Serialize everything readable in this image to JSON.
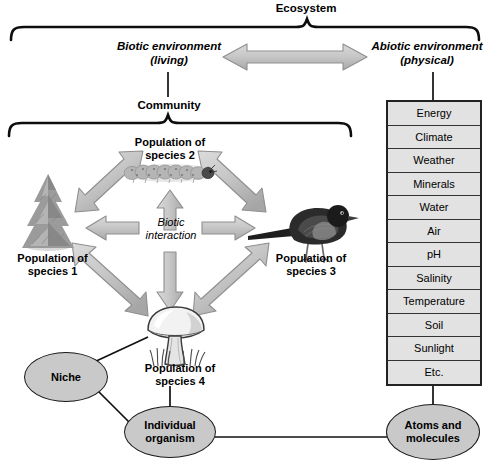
{
  "diagram": {
    "ecosystem_label": "Ecosystem",
    "biotic_label": "Biotic environment\n(living)",
    "abiotic_label": "Abiotic environment\n(physical)",
    "community_label": "Community",
    "biotic_interaction_label": "Biotic\ninteraction"
  },
  "populations": [
    {
      "id": "species1",
      "label": "Population of\nspecies 1",
      "organism": "conifer-tree"
    },
    {
      "id": "species2",
      "label": "Population of\nspecies 2",
      "organism": "caterpillar"
    },
    {
      "id": "species3",
      "label": "Population of\nspecies 3",
      "organism": "bird"
    },
    {
      "id": "species4",
      "label": "Population of\nspecies 4",
      "organism": "mushroom"
    }
  ],
  "abiotic_factors": [
    "Energy",
    "Climate",
    "Weather",
    "Minerals",
    "Water",
    "Air",
    "pH",
    "Salinity",
    "Temperature",
    "Soil",
    "Sunlight",
    "Etc."
  ],
  "nodes": {
    "niche": "Niche",
    "individual_organism": "Individual\norganism",
    "atoms_and_molecules": "Atoms and\nmolecules"
  },
  "colors": {
    "arrow_fill": "#c4c4c4",
    "arrow_stroke": "#8a8a8a",
    "oval_fill": "#c9c9c9",
    "table_fill": "#e2e2e2",
    "line": "#111111",
    "text": "#000000",
    "background": "#ffffff"
  }
}
